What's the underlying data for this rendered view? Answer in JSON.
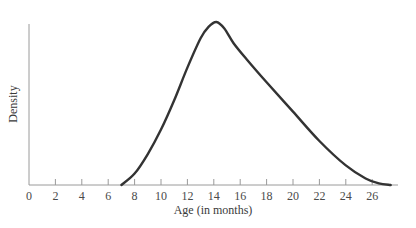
{
  "chart_data": {
    "type": "line",
    "title": "",
    "xlabel": "Age (in months)",
    "ylabel": "Density",
    "xlim": [
      0,
      28
    ],
    "x_ticks": [
      0,
      2,
      4,
      6,
      8,
      10,
      12,
      14,
      16,
      18,
      20,
      22,
      24,
      26
    ],
    "y_ticks": [],
    "grid": false,
    "legend": null,
    "series": [
      {
        "name": "density",
        "x": [
          7.0,
          8.0,
          9.0,
          10.0,
          11.0,
          12.0,
          13.0,
          13.6,
          14.2,
          14.8,
          15.5,
          16.5,
          18.0,
          20.0,
          22.0,
          24.0,
          25.5,
          26.5,
          27.4
        ],
        "y": [
          0.0,
          0.07,
          0.19,
          0.34,
          0.52,
          0.72,
          0.9,
          0.97,
          1.0,
          0.96,
          0.87,
          0.77,
          0.63,
          0.45,
          0.27,
          0.12,
          0.04,
          0.01,
          0.0
        ]
      }
    ],
    "color": "#333333"
  }
}
